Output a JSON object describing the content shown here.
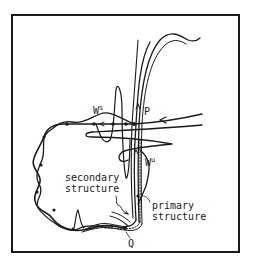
{
  "figure": {
    "labels": {
      "ws_base": "W",
      "ws_sup": "s",
      "wu_base": "W",
      "wu_sup": "u",
      "p": "P",
      "q": "Q",
      "secondary_line1": "secondary",
      "secondary_line2": "structure",
      "primary_line1": "primary",
      "primary_line2": "structure"
    },
    "colors": {
      "ink": "#1a1a1a",
      "background": "#ffffff"
    }
  }
}
